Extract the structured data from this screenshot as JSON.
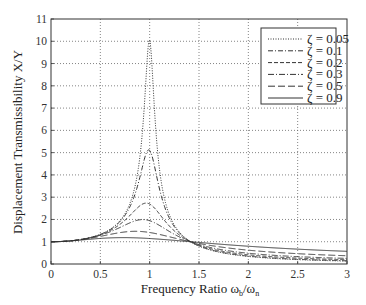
{
  "chart_data": {
    "type": "line",
    "title": "",
    "xlabel": "Frequency Ratio ω_b/ω_n",
    "xlabel_main": "Frequency Ratio ω",
    "xlabel_sub1": "b",
    "xlabel_slash": "/ω",
    "xlabel_sub2": "n",
    "ylabel": "Displacement Transmissibility X/Y",
    "xlim": [
      0,
      3
    ],
    "ylim": [
      0,
      11
    ],
    "xticks": [
      0,
      0.5,
      1,
      1.5,
      2,
      2.5,
      3
    ],
    "xtick_labels": [
      "0",
      "0.5",
      "1",
      "1.5",
      "2",
      "2.5",
      "3"
    ],
    "yticks": [
      0,
      1,
      2,
      3,
      4,
      5,
      6,
      7,
      8,
      9,
      10,
      11
    ],
    "ytick_labels": [
      "0",
      "1",
      "2",
      "3",
      "4",
      "5",
      "6",
      "7",
      "8",
      "9",
      "10",
      "11"
    ],
    "grid": true,
    "legend_position": "upper right",
    "x": [
      0,
      0.1,
      0.2,
      0.3,
      0.4,
      0.5,
      0.6,
      0.7,
      0.8,
      0.85,
      0.9,
      0.95,
      1.0,
      1.05,
      1.1,
      1.15,
      1.2,
      1.3,
      1.414,
      1.5,
      1.75,
      2.0,
      2.25,
      2.5,
      2.75,
      3.0
    ],
    "series": [
      {
        "name": "ζ = 0.05",
        "zeta": 0.05,
        "dash": "1,1.5",
        "values": [
          1.0,
          1.01,
          1.04,
          1.1,
          1.19,
          1.33,
          1.56,
          1.96,
          2.76,
          3.5,
          4.9,
          7.6,
          10.05,
          7.0,
          4.3,
          3.0,
          2.28,
          1.45,
          1.0,
          0.81,
          0.49,
          0.34,
          0.25,
          0.2,
          0.16,
          0.13
        ]
      },
      {
        "name": "ζ = 0.1",
        "zeta": 0.1,
        "dash": "5,2,1,2",
        "values": [
          1.0,
          1.01,
          1.04,
          1.1,
          1.19,
          1.33,
          1.55,
          1.93,
          2.63,
          3.2,
          4.1,
          5.0,
          5.1,
          4.5,
          3.6,
          2.8,
          2.2,
          1.45,
          1.0,
          0.83,
          0.53,
          0.39,
          0.31,
          0.25,
          0.21,
          0.18
        ]
      },
      {
        "name": "ζ = 0.2",
        "zeta": 0.2,
        "dash": "4,2",
        "values": [
          1.0,
          1.01,
          1.04,
          1.09,
          1.18,
          1.3,
          1.5,
          1.8,
          2.25,
          2.5,
          2.7,
          2.75,
          2.69,
          2.5,
          2.25,
          2.0,
          1.8,
          1.38,
          1.0,
          0.87,
          0.63,
          0.5,
          0.42,
          0.36,
          0.32,
          0.29
        ]
      },
      {
        "name": "ζ = 0.3",
        "zeta": 0.3,
        "dash": "6,2,1,2",
        "values": [
          1.0,
          1.01,
          1.04,
          1.09,
          1.16,
          1.26,
          1.4,
          1.6,
          1.84,
          1.95,
          2.02,
          2.04,
          2.02,
          1.95,
          1.85,
          1.72,
          1.6,
          1.32,
          1.0,
          0.9,
          0.71,
          0.6,
          0.53,
          0.48,
          0.44,
          0.41
        ]
      },
      {
        "name": "ζ = 0.5",
        "zeta": 0.5,
        "dash": "7,3",
        "values": [
          1.0,
          1.01,
          1.03,
          1.07,
          1.12,
          1.18,
          1.26,
          1.34,
          1.41,
          1.43,
          1.44,
          1.43,
          1.41,
          1.38,
          1.34,
          1.29,
          1.24,
          1.13,
          1.0,
          0.94,
          0.81,
          0.72,
          0.66,
          0.62,
          0.59,
          0.56
        ]
      },
      {
        "name": "ζ = 0.9",
        "zeta": 0.9,
        "dash": "",
        "values": [
          1.0,
          1.01,
          1.02,
          1.04,
          1.07,
          1.09,
          1.12,
          1.14,
          1.16,
          1.16,
          1.16,
          1.16,
          1.15,
          1.14,
          1.12,
          1.1,
          1.08,
          1.04,
          1.0,
          0.98,
          0.91,
          0.86,
          0.81,
          0.77,
          0.74,
          0.72
        ]
      }
    ]
  }
}
